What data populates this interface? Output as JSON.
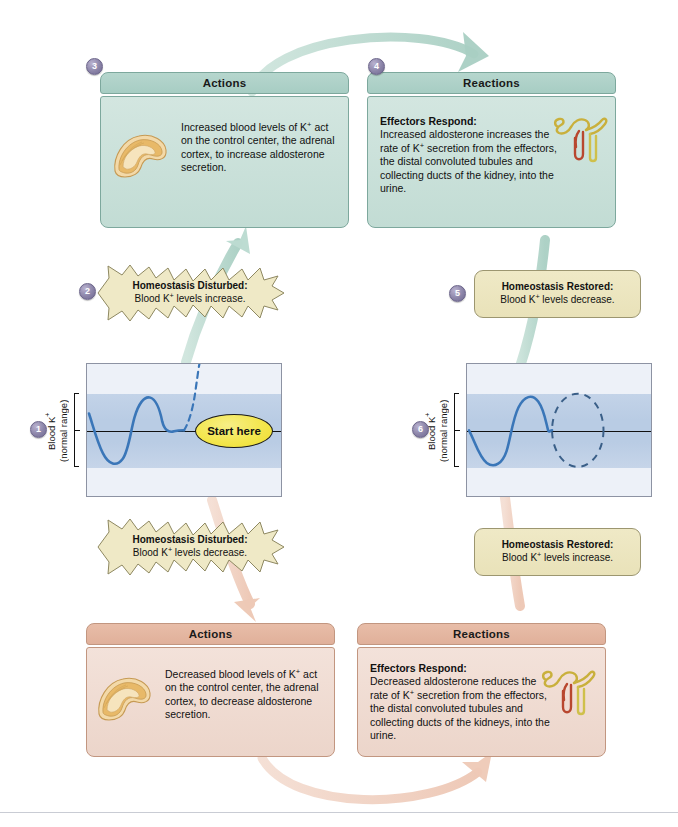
{
  "diagram": {
    "colors": {
      "increase_accent": "#a7cdc3",
      "decrease_accent": "#e0b09a",
      "callout_yellow": "#efe9c6",
      "graph_band": "#b9cce4",
      "curve_blue": "#3a76b8",
      "badge_purple": "#8b84a8",
      "start_here_yellow": "#f3e64e"
    }
  },
  "steps": {
    "one": "1",
    "two": "2",
    "three": "3",
    "four": "4",
    "five": "5",
    "six": "6"
  },
  "top_actions": {
    "header": "Actions",
    "body": "Increased blood levels of K+ act on the control center, the adrenal cortex, to increase aldosterone secretion.",
    "icon": "adrenal-gland-icon"
  },
  "top_reactions": {
    "header": "Reactions",
    "lead": "Effectors Respond:",
    "body": "Increased aldosterone increases the rate of K+ secretion from the effectors, the distal convoluted tubules and collecting ducts of the kidney, into the urine.",
    "icon": "nephron-icon"
  },
  "bottom_actions": {
    "header": "Actions",
    "body": "Decreased blood levels of K+ act on the control center, the adrenal cortex, to decrease aldosterone secretion.",
    "icon": "adrenal-gland-icon"
  },
  "bottom_reactions": {
    "header": "Reactions",
    "lead": "Effectors Respond:",
    "body": "Decreased aldosterone reduces the rate of K+ secretion from the effectors, the distal convoluted tubules and collecting ducts of the kidneys, into the urine.",
    "icon": "nephron-icon"
  },
  "callouts": {
    "disturbed_up": {
      "lead": "Homeostasis Disturbed:",
      "detail": "Blood K+ levels increase.",
      "shape": "starburst"
    },
    "restored_down": {
      "lead": "Homeostasis Restored:",
      "detail": "Blood K+ levels decrease.",
      "shape": "rounded-rect"
    },
    "disturbed_down": {
      "lead": "Homeostasis Disturbed:",
      "detail": "Blood K+ levels decrease.",
      "shape": "starburst"
    },
    "restored_up": {
      "lead": "Homeostasis Restored:",
      "detail": "Blood K+ levels increase.",
      "shape": "rounded-rect"
    }
  },
  "graph_left": {
    "axis_label_line1": "Blood K+",
    "axis_label_line2": "(normal range)",
    "start_here_label": "Start here"
  },
  "graph_right": {
    "axis_label_line1": "Blood K+",
    "axis_label_line2": "(normal range)"
  },
  "chart_data": {
    "type": "line",
    "ylabel": "Blood K+ (normal range)",
    "xlabel": "",
    "grid": false,
    "legend": "none",
    "ylim": [
      -1.6,
      1.6
    ],
    "normal_range_band": [
      -1.0,
      1.0
    ],
    "midline": 0,
    "series": [
      {
        "name": "left-panel-observed",
        "style": "solid",
        "color": "#3a76b8",
        "x": [
          0.0,
          0.08,
          0.18,
          0.3,
          0.42,
          0.54,
          0.64,
          0.74,
          0.86,
          1.0
        ],
        "y": [
          0.45,
          0.05,
          -0.72,
          -0.98,
          -0.4,
          0.62,
          0.95,
          0.62,
          0.05,
          -0.05
        ]
      },
      {
        "name": "left-panel-projected",
        "style": "dashed",
        "color": "#3a76b8",
        "x": [
          1.0,
          1.12,
          1.28,
          1.46,
          1.62
        ],
        "y": [
          -0.05,
          0.55,
          1.15,
          1.45,
          1.6
        ]
      },
      {
        "name": "right-panel-observed",
        "style": "solid",
        "color": "#3a76b8",
        "x": [
          0.0,
          0.1,
          0.22,
          0.34,
          0.46,
          0.58,
          0.7,
          0.82,
          0.94
        ],
        "y": [
          0.0,
          -0.55,
          -0.95,
          -0.55,
          0.25,
          0.92,
          0.95,
          0.45,
          0.0
        ]
      },
      {
        "name": "right-panel-restored-loop",
        "style": "dashed-ellipse",
        "color": "#3a5f88",
        "note": "dashed ellipse showing value returning to normal range"
      }
    ]
  }
}
